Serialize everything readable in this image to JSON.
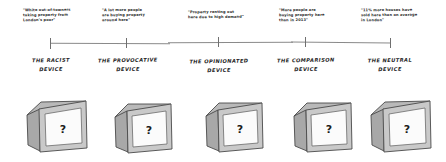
{
  "diagram": {
    "axis": {
      "orientation": "horizontal",
      "tick_count": 5,
      "line_color": "#8a8a8a"
    },
    "question_mark": "?",
    "points": [
      {
        "id": "racist",
        "quote": "\"White out-of-towners\ntaking property from\nLondon's poor\"",
        "label": "THE RACIST\nDEVICE",
        "tick_x": 50
      },
      {
        "id": "provocative",
        "quote": "\"A lot more people\nare buying property\naround here\"",
        "label": "THE PROVOCATIVE\nDEVICE",
        "tick_x": 126
      },
      {
        "id": "opinionated",
        "quote": "\"Property renting out\nhere due to high demand\"",
        "label": "THE OPINIONATED\nDEVICE",
        "tick_x": 218
      },
      {
        "id": "comparison",
        "quote": "\"More people are\nbuying property here\nthan in 2013\"",
        "label": "THE COMPARISON\nDEVICE",
        "tick_x": 305
      },
      {
        "id": "neutral",
        "quote": "\"11% more houses have\nsold here than on average\nin London\"",
        "label": "THE NEUTRAL\nDEVICE",
        "tick_x": 390
      }
    ]
  }
}
